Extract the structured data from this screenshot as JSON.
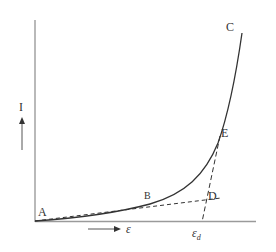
{
  "diagram": {
    "type": "current-strain curve",
    "labels": {
      "y_axis": "I",
      "x_axis": "ε",
      "point_a": "A",
      "point_b": "B",
      "point_c": "C",
      "point_d": "D",
      "point_e": "E",
      "eps_d_main": "ε",
      "eps_d_sub": "d"
    },
    "colors": {
      "curve": "#333333",
      "axes": "#777777",
      "dashed": "#333333",
      "text": "#333333"
    }
  }
}
